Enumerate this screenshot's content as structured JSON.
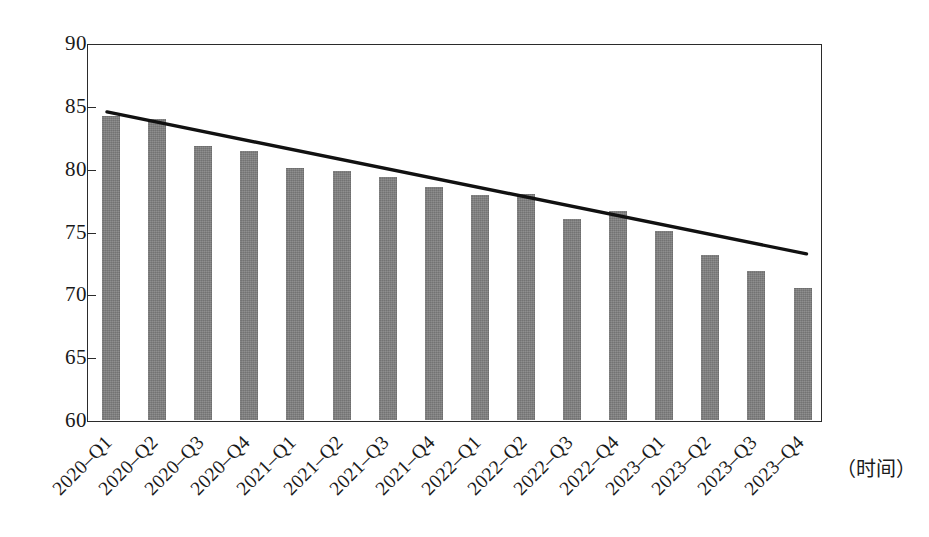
{
  "chart_data": {
    "type": "bar",
    "title": "",
    "subtitle": "",
    "xlabel": "（时间）",
    "ylabel": "",
    "ylim": [
      60,
      90
    ],
    "ytick_step": 5,
    "ytick_labels": [
      "90",
      "85",
      "80",
      "75",
      "70",
      "65",
      "60"
    ],
    "yticks": [
      90,
      85,
      80,
      75,
      70,
      65,
      60
    ],
    "grid": false,
    "legend": null,
    "legend_position": "none",
    "categories": [
      "2020–Q1",
      "2020–Q2",
      "2020–Q3",
      "2020–Q4",
      "2021–Q1",
      "2021–Q2",
      "2021–Q3",
      "2021–Q4",
      "2022–Q1",
      "2022–Q2",
      "2022–Q3",
      "2022–Q4",
      "2023–Q1",
      "2023–Q2",
      "2023–Q3",
      "2023–Q4"
    ],
    "values": [
      84.3,
      84.0,
      81.9,
      81.5,
      80.1,
      79.9,
      79.4,
      78.6,
      78.0,
      78.1,
      76.1,
      76.7,
      75.1,
      73.2,
      71.9,
      70.6
    ],
    "series": [
      {
        "name": "",
        "type": "bar",
        "color": "#7e7e7e",
        "values": [
          84.3,
          84.0,
          81.9,
          81.5,
          80.1,
          79.9,
          79.4,
          78.6,
          78.0,
          78.1,
          76.1,
          76.7,
          75.1,
          73.2,
          71.9,
          70.6
        ]
      },
      {
        "name": "trendline",
        "type": "line",
        "color": "#111111",
        "start_value": 84.6,
        "end_value": 73.3,
        "start_category": "2020–Q1",
        "end_category": "2023–Q4"
      }
    ],
    "annotations": []
  },
  "style": {
    "bar_color": "#7e7e7e",
    "trend_color": "#111111",
    "axis_color": "#2b2b2b",
    "background": "#ffffff"
  }
}
